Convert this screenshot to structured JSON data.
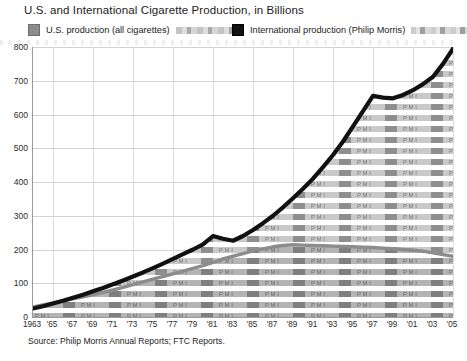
{
  "title": "U.S. and International Cigarette Production, in Billions",
  "legend": {
    "us": {
      "label": "U.S. production (all cigarettes)",
      "color": "#8c8c8c"
    },
    "intl": {
      "label": "International production (Philip Morris)",
      "color": "#111111"
    }
  },
  "source": "Source: Philip Morris Annual Reports; FTC Reports.",
  "axis": {
    "y_ticks": [
      "800",
      "700",
      "600",
      "500",
      "400",
      "300",
      "200",
      "100",
      "0"
    ],
    "x_ticks": [
      "1963",
      "'65",
      "'67",
      "'69",
      "'71",
      "'73",
      "'75",
      "'77",
      "'79",
      "'81",
      "'83",
      "'85",
      "'87",
      "'89",
      "'91",
      "'93",
      "'95",
      "'97",
      "'99",
      "'01",
      "'03",
      "'05"
    ]
  },
  "watermark_text": "P M I",
  "chart_data": {
    "type": "area",
    "title": "U.S. and International Cigarette Production, in Billions",
    "subtitle": "",
    "xlabel": "",
    "ylabel": "Billions of cigarettes",
    "ylim": [
      0,
      800
    ],
    "xlim": [
      1963,
      2005
    ],
    "grid": true,
    "legend_position": "top",
    "source": "Source: Philip Morris Annual Reports; FTC Reports.",
    "x": [
      1963,
      1964,
      1965,
      1966,
      1967,
      1968,
      1969,
      1970,
      1971,
      1972,
      1973,
      1974,
      1975,
      1976,
      1977,
      1978,
      1979,
      1980,
      1981,
      1982,
      1983,
      1984,
      1985,
      1986,
      1987,
      1988,
      1989,
      1990,
      1991,
      1992,
      1993,
      1994,
      1995,
      1996,
      1997,
      1998,
      1999,
      2000,
      2001,
      2002,
      2003,
      2004,
      2005
    ],
    "series": [
      {
        "name": "U.S. production (all cigarettes)",
        "color": "#8c8c8c",
        "style": "filled-area",
        "values": [
          30,
          36,
          42,
          48,
          54,
          60,
          66,
          73,
          80,
          88,
          96,
          104,
          112,
          120,
          128,
          136,
          144,
          152,
          162,
          172,
          180,
          188,
          196,
          202,
          208,
          212,
          214,
          213,
          212,
          211,
          210,
          209,
          208,
          207,
          206,
          204,
          202,
          200,
          198,
          195,
          190,
          185,
          180
        ]
      },
      {
        "name": "International production (Philip Morris)",
        "color": "#111111",
        "style": "thick-line",
        "values": [
          25,
          32,
          40,
          48,
          57,
          66,
          76,
          86,
          97,
          108,
          120,
          132,
          145,
          158,
          172,
          186,
          200,
          215,
          240,
          232,
          226,
          240,
          258,
          278,
          300,
          325,
          352,
          380,
          410,
          444,
          480,
          520,
          565,
          610,
          655,
          650,
          648,
          658,
          672,
          690,
          712,
          750,
          795
        ]
      }
    ]
  }
}
